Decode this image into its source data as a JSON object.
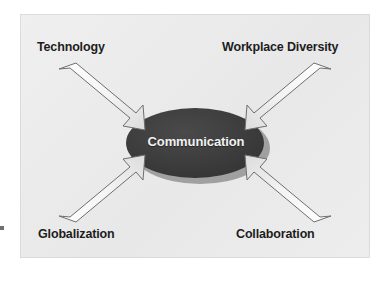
{
  "diagram": {
    "type": "hub-and-spoke",
    "background_color": "#ffffff",
    "panel_color": "#ebebeb",
    "center": {
      "label": "Communication",
      "shape": "ellipse",
      "fill_color": "#3a3a3a",
      "text_color": "#f2f2f2",
      "shadow_color": "#9a9a9a"
    },
    "arrows": [
      {
        "name": "technology-arrow",
        "direction": "down-right",
        "from": "top-left",
        "to": "center",
        "fill_color": "#f4f4f4",
        "stroke_color": "#6b6b6b"
      },
      {
        "name": "workplace-diversity-arrow",
        "direction": "down-left",
        "from": "top-right",
        "to": "center",
        "fill_color": "#f4f4f4",
        "stroke_color": "#6b6b6b"
      },
      {
        "name": "globalization-arrow",
        "direction": "up-right",
        "from": "bottom-left",
        "to": "center",
        "fill_color": "#f4f4f4",
        "stroke_color": "#6b6b6b"
      },
      {
        "name": "collaboration-arrow",
        "direction": "up-left",
        "from": "bottom-right",
        "to": "center",
        "fill_color": "#f4f4f4",
        "stroke_color": "#6b6b6b"
      }
    ],
    "labels": {
      "top_left": "Technology",
      "top_right": "Workplace Diversity",
      "bottom_left": "Globalization",
      "bottom_right": "Collaboration"
    },
    "label_color": "#1d1d1d"
  }
}
